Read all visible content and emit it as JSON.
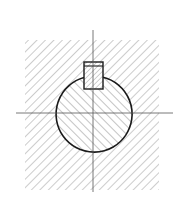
{
  "figure": {
    "type": "technical-drawing",
    "colors": {
      "outline": "#1a1a1a",
      "hatch": "#9a9a9a",
      "centerline": "#555555",
      "background": "#ffffff"
    },
    "hub": {
      "x": 25,
      "y": 40,
      "width": 134,
      "height": 150,
      "hatch_direction": "/"
    },
    "shaft": {
      "cx": 94,
      "cy": 114,
      "r": 38,
      "hatch_direction": "\\"
    },
    "key": {
      "x": 84,
      "y": 62,
      "width": 19,
      "height": 27,
      "inner_line_y": 66,
      "hatch_direction": "/"
    },
    "centerlines": {
      "horizontal": {
        "x1": 16,
        "x2": 173,
        "y": 113
      },
      "vertical": {
        "x": 93,
        "y1": 30,
        "y2": 192
      }
    },
    "caption": ""
  }
}
